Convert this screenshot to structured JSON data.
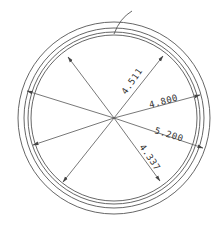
{
  "drawing": {
    "type": "circular cross-section with radial dimensions",
    "colors": {
      "line": "#555555",
      "text": "#333333",
      "background": "#ffffff"
    },
    "center": [
      114,
      118
    ],
    "rings": [
      96,
      90,
      86,
      83
    ],
    "dimensions": [
      {
        "id": "dim-upper-right",
        "label": "4.511",
        "end": [
          163,
          56
        ],
        "text_pos": [
          126,
          95
        ],
        "angle": -55
      },
      {
        "id": "dim-right-upper",
        "label": "4.800",
        "end": [
          200,
          95
        ],
        "text_pos": [
          150,
          108
        ],
        "angle": -15
      },
      {
        "id": "dim-right-lower",
        "label": "5.200",
        "end": [
          203,
          148
        ],
        "text_pos": [
          154,
          133
        ],
        "angle": 17
      },
      {
        "id": "dim-lower-right",
        "label": "4.337",
        "end": [
          160,
          181
        ],
        "text_pos": [
          139,
          147
        ],
        "angle": 55
      }
    ],
    "unlabeled_radials": [
      {
        "id": "radial-upper-left",
        "end": [
          68,
          57
        ]
      },
      {
        "id": "radial-left-upper",
        "end": [
          27,
          91
        ]
      },
      {
        "id": "radial-left-lower",
        "end": [
          33,
          145
        ]
      },
      {
        "id": "radial-lower-left",
        "end": [
          63,
          182
        ]
      }
    ],
    "leader": {
      "from": [
        114,
        34
      ],
      "ctrl": [
        120,
        18
      ],
      "to": [
        132,
        11
      ]
    }
  }
}
